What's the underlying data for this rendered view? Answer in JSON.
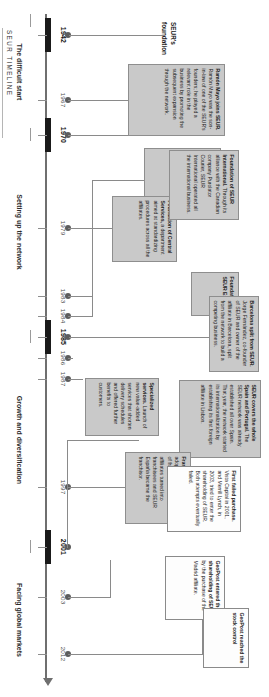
{
  "meta": {
    "timeline_title": "SEUR TIMELINE",
    "foundation_label_line1": "SEUR's",
    "foundation_label_line2": "foundation"
  },
  "axis": {
    "years": [
      {
        "year": "1942",
        "bold": true
      },
      {
        "year": "1967",
        "bold": false
      },
      {
        "year": "1970",
        "bold": true
      },
      {
        "year": "1979",
        "bold": false
      },
      {
        "year": "1983",
        "bold": false
      },
      {
        "year": "1984",
        "bold": false
      },
      {
        "year": "1985",
        "bold": true
      },
      {
        "year": "1986",
        "bold": false
      },
      {
        "year": "1987",
        "bold": false
      },
      {
        "year": "1997",
        "bold": false
      },
      {
        "year": "2001",
        "bold": true
      },
      {
        "year": "2003",
        "bold": false
      },
      {
        "year": "2012",
        "bold": false
      }
    ]
  },
  "eras": [
    {
      "label": "The difficult start"
    },
    {
      "label": "Setting up the network"
    },
    {
      "label": "Growth and diversification"
    },
    {
      "label": "Facing global markets"
    }
  ],
  "events": [
    {
      "id": "ramon-mayo",
      "year": "1967",
      "heading": "Ramón Mayo joins SEUR.",
      "body": " Ramón Mayo was the son-in-law of one of the SEUR's founders; he played a relevant role in the business by promoting the subsequent expansion through the network."
    },
    {
      "id": "starting-point",
      "year": "1970",
      "heading": "Starting point of the SEUR network.",
      "body": " Initial affiliate was set up as the first founded after Madrid and Barcelona."
    },
    {
      "id": "central-services",
      "year": "1979",
      "heading": "Foundation of Central Services,",
      "body": " a department aimed at standardizing procedures across all the affiliates."
    },
    {
      "id": "seur-espana",
      "year": "1983",
      "heading": "Foundation of SEUR España",
      "body": ""
    },
    {
      "id": "seur-international",
      "year": "1984",
      "heading": "Foundation of SEUR International.",
      "body": " Through its alliance with the Canadian company Purolator Courier, SEUR International operated all the international business."
    },
    {
      "id": "barcelona-split",
      "year": "1985",
      "heading": "Barcelona split from SEUR.",
      "body": " Jorge Fernández, co-founder of SEUR and owner of the affiliate in Barcelona, split from the network to build a competing business."
    },
    {
      "id": "spain-portugal",
      "year": "1986",
      "heading": "SEUR covers the whole Spain and Portugal.",
      "body": " The SEUR network was already established all over Spain. That year, the network started its internationalization by establishing its first foreign affiliate in Lisbon."
    },
    {
      "id": "specialized-services",
      "year": "1987",
      "heading": "Specialized services.",
      "body": " Launch of new value-added services that shorten delivery schedules and offered further benefits to customers."
    },
    {
      "id": "franchise-system",
      "year": "1997",
      "heading": "Franchise system SEUR",
      "body": " adopted the legal structure of franchise. The former affiliates turned into franchisees and SEUR España became the franchisor."
    },
    {
      "id": "first-failed-purchase",
      "year": "2001",
      "heading": "First failed purchase.",
      "body": " Vista Capital in 2001, and Merrill Lynch, in 2003, tried to enter the shareholding of SEUR. Both attempts eventually failed."
    },
    {
      "id": "geopost-shareholding",
      "year": "2003",
      "heading": "GeoPost entered the shareholding of SEUR",
      "body": " by the purchase of the Madrid affiliate."
    },
    {
      "id": "geopost-stock-control",
      "year": "2012",
      "heading": "GeoPost reached the stock control",
      "body": ""
    }
  ],
  "colors": {
    "box_grey": "#c9c9c9",
    "box_white": "#fdfdfd",
    "axis": "#6f6f6f",
    "era_bar": "#1a1a1a",
    "dot": "#5d5d5d"
  }
}
